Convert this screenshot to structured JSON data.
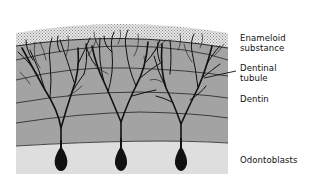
{
  "figure": {
    "type": "cross-section illustration",
    "layers": [
      {
        "name": "Enameloid substance",
        "color": "#d4d4d4",
        "pattern": "stippled"
      },
      {
        "name": "Dentin",
        "color": "#a3a3a3",
        "pattern": "solid with incremental lines"
      },
      {
        "name": "Odontoblast layer",
        "color": "#dedede",
        "pattern": "solid"
      }
    ],
    "cell_count": 3,
    "colors": {
      "outline": "#111111",
      "enameloid": "#d4d4d4",
      "dentin": "#a3a3a3",
      "pulp": "#dedede"
    }
  },
  "labels": {
    "enameloid_line1": "Enameloid",
    "enameloid_line2": "substance",
    "dentinal_line1": "Dentinal",
    "dentinal_line2": "tubule",
    "dentin": "Dentin",
    "odontoblasts": "Odontoblasts"
  }
}
